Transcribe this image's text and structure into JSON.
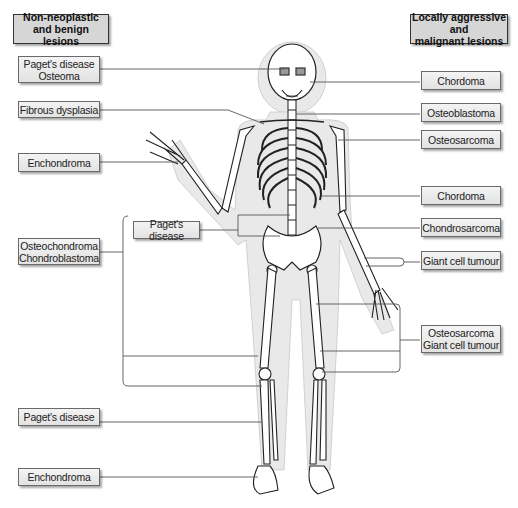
{
  "headers": {
    "left": [
      "Non-neoplastic",
      "and benign lesions"
    ],
    "right": [
      "Locally aggressive and",
      "malignant lesions"
    ]
  },
  "left_labels": [
    {
      "lines": [
        "Paget's disease",
        "Osteoma"
      ],
      "site": "skull"
    },
    {
      "lines": [
        "Fibrous dysplasia"
      ],
      "site": "ribs"
    },
    {
      "lines": [
        "Enchondroma"
      ],
      "site": "hand"
    },
    {
      "lines": [
        "Paget's disease"
      ],
      "site": "pelvis / spine"
    },
    {
      "lines": [
        "Osteochondroma",
        "Chondroblastoma"
      ],
      "site": "around knee / long bones"
    },
    {
      "lines": [
        "Paget's disease"
      ],
      "site": "tibia"
    },
    {
      "lines": [
        "Enchondroma"
      ],
      "site": "foot"
    }
  ],
  "right_labels": [
    {
      "lines": [
        "Chordoma"
      ],
      "site": "skull base"
    },
    {
      "lines": [
        "Osteoblastoma"
      ],
      "site": "cervical spine"
    },
    {
      "lines": [
        "Osteosarcoma"
      ],
      "site": "proximal humerus"
    },
    {
      "lines": [
        "Chordoma"
      ],
      "site": "lumbar spine"
    },
    {
      "lines": [
        "Chondrosarcoma"
      ],
      "site": "pelvis"
    },
    {
      "lines": [
        "Giant cell tumour"
      ],
      "site": "distal radius"
    },
    {
      "lines": [
        "Osteosarcoma",
        "Giant cell tumour"
      ],
      "site": "around knee"
    }
  ],
  "colors": {
    "label_fill": "#e6e6e6",
    "header_fill": "#d6d6d6",
    "body_outline": "#e8e8e8",
    "leader_line": "#555555"
  }
}
